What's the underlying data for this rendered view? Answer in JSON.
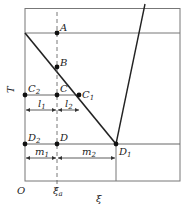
{
  "figure": {
    "axes": {
      "y_label": "T",
      "x_label": "ξ",
      "origin_label": "O",
      "x_tick_label": "ξ",
      "x_tick_sub": "a"
    },
    "points": {
      "A": {
        "label": "A"
      },
      "B": {
        "label": "B"
      },
      "C": {
        "label": "C"
      },
      "C1": {
        "label": "C",
        "sub": "1"
      },
      "C2": {
        "label": "C",
        "sub": "2"
      },
      "D": {
        "label": "D"
      },
      "D1": {
        "label": "D",
        "sub": "1"
      },
      "D2": {
        "label": "D",
        "sub": "2"
      }
    },
    "segments": {
      "l1": {
        "label": "l",
        "sub": "1"
      },
      "l2": {
        "label": "l",
        "sub": "2"
      },
      "m1": {
        "label": "m",
        "sub": "1"
      },
      "m2": {
        "label": "m",
        "sub": "2"
      }
    },
    "colors": {
      "frame": "#777777",
      "curve": "#222222",
      "dash": "#555555",
      "point": "#111111"
    }
  }
}
